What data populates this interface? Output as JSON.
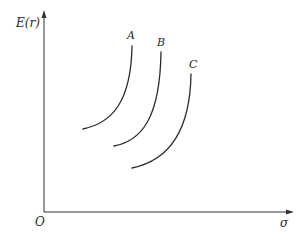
{
  "diagram": {
    "type": "efficient-frontier-curves",
    "y_axis_label": "E(r)",
    "x_axis_label": "σ",
    "origin_label": "O",
    "curves": [
      {
        "id": "A",
        "label": "A"
      },
      {
        "id": "B",
        "label": "B"
      },
      {
        "id": "C",
        "label": "C"
      }
    ],
    "colors": {
      "ink": "#2b2b2b",
      "background": "#ffffff"
    }
  }
}
